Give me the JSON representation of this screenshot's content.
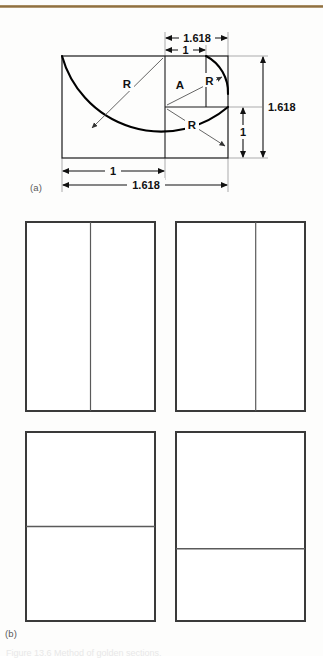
{
  "figure": {
    "panel_a_label": "(a)",
    "panel_b_label": "(b)",
    "caption": "Figure 13.6   Method of golden sections."
  },
  "diagram_a": {
    "name": "golden-ratio-construction",
    "dimension_labels": {
      "top_outer": "1.618",
      "top_inner": "1",
      "right_outer": "1.618",
      "right_inner": "1",
      "bottom_inner": "1",
      "bottom_outer": "1.618"
    },
    "radius_labels": [
      "R",
      "R",
      "R"
    ],
    "point_labels": [
      "A"
    ],
    "geometry": {
      "rect_left": 62,
      "rect_top": 56,
      "rect_right": 228,
      "rect_bottom": 158,
      "square_left": 62,
      "square_right": 165,
      "mid_y": 107,
      "inner_x": 206,
      "big_radius_R": 103,
      "small_radius_R": 41
    },
    "colors": {
      "stroke": "#1a1a1a",
      "thin_stroke": "#555555",
      "arc": "#000000"
    }
  },
  "diagram_b": {
    "name": "golden-section-rectangles",
    "rectangles": [
      {
        "id": "rect-top-left",
        "divider": "vertical",
        "divider_fraction": 0.5,
        "x": 26,
        "y": 222,
        "w": 129,
        "h": 189
      },
      {
        "id": "rect-top-right",
        "divider": "vertical",
        "divider_fraction": 0.618,
        "x": 176,
        "y": 222,
        "w": 129,
        "h": 189
      },
      {
        "id": "rect-bottom-left",
        "divider": "horizontal",
        "divider_fraction": 0.5,
        "x": 26,
        "y": 432,
        "w": 129,
        "h": 189
      },
      {
        "id": "rect-bottom-right",
        "divider": "horizontal",
        "divider_fraction": 0.618,
        "x": 176,
        "y": 432,
        "w": 129,
        "h": 189
      }
    ],
    "colors": {
      "outline": "#3a3a3a",
      "divider": "#5a5a5a"
    }
  },
  "theme": {
    "page_background": "#fdfdfc",
    "rule_color": "#8a6a3a",
    "ink": "#111111"
  }
}
